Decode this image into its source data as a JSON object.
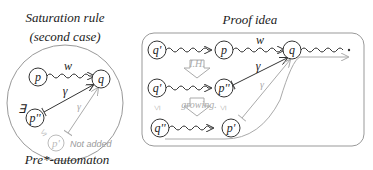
{
  "left_panel": {
    "title_line1": "Saturation rule",
    "title_line2": "(second case)",
    "caption": "Pre*-automaton",
    "nodes": {
      "p": "p",
      "q": "q",
      "p_dprime": "p''",
      "p_prime": "p'"
    },
    "edges": {
      "w_label": "w",
      "gamma_label": "γ",
      "gamma_faint_label": "γ"
    },
    "exists_symbol": "∃",
    "leq_symbol": "≤",
    "not_added_label": "Not added"
  },
  "right_panel": {
    "title": "Proof idea",
    "nodes": {
      "row1_q_prime": "q'",
      "row1_p": "p",
      "row1_q": "q",
      "row2_q_prime": "q'",
      "row2_p_dprime": "p''",
      "row3_q_dprime": "q''",
      "row3_p_prime": "p'"
    },
    "edges": {
      "w_label": "w",
      "gamma_label": "γ",
      "gamma_faint_label": "γ"
    },
    "ih_label": "I.H.",
    "growing_label": "growing.",
    "leq_symbol": "≤"
  }
}
